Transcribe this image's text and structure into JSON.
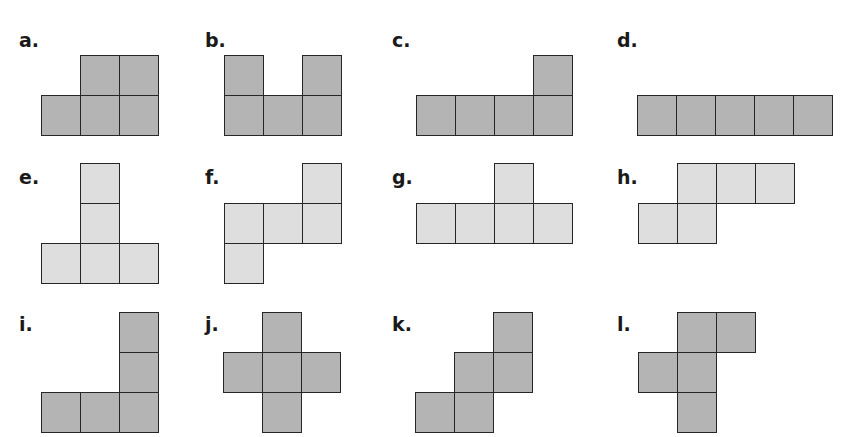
{
  "figure": {
    "cell_size": {
      "w": 39,
      "h": 40
    },
    "colors": {
      "dark_fill": "#b4b4b4",
      "light_fill": "#dedede",
      "border": "#262626",
      "label": "#1a1a1a"
    },
    "pentominoes": [
      {
        "label": "a.",
        "label_pos": [
          19,
          31
        ],
        "origin": [
          41,
          55
        ],
        "fill": "dark",
        "cells": [
          [
            1,
            0
          ],
          [
            2,
            0
          ],
          [
            0,
            1
          ],
          [
            1,
            1
          ],
          [
            2,
            1
          ]
        ]
      },
      {
        "label": "b.",
        "label_pos": [
          205,
          31
        ],
        "origin": [
          224,
          55
        ],
        "fill": "dark",
        "cells": [
          [
            0,
            0
          ],
          [
            2,
            0
          ],
          [
            0,
            1
          ],
          [
            1,
            1
          ],
          [
            2,
            1
          ]
        ]
      },
      {
        "label": "c.",
        "label_pos": [
          392,
          31
        ],
        "origin": [
          416,
          55
        ],
        "fill": "dark",
        "cells": [
          [
            3,
            0
          ],
          [
            0,
            1
          ],
          [
            1,
            1
          ],
          [
            2,
            1
          ],
          [
            3,
            1
          ]
        ]
      },
      {
        "label": "d.",
        "label_pos": [
          617,
          31
        ],
        "origin": [
          637,
          55
        ],
        "fill": "dark",
        "cells": [
          [
            0,
            1
          ],
          [
            1,
            1
          ],
          [
            2,
            1
          ],
          [
            3,
            1
          ],
          [
            4,
            1
          ]
        ]
      },
      {
        "label": "e.",
        "label_pos": [
          19,
          168
        ],
        "origin": [
          41,
          163
        ],
        "fill": "light",
        "cells": [
          [
            1,
            0
          ],
          [
            1,
            1
          ],
          [
            0,
            2
          ],
          [
            1,
            2
          ],
          [
            2,
            2
          ]
        ]
      },
      {
        "label": "f.",
        "label_pos": [
          205,
          168
        ],
        "origin": [
          224,
          163
        ],
        "fill": "light",
        "cells": [
          [
            2,
            0
          ],
          [
            0,
            1
          ],
          [
            1,
            1
          ],
          [
            2,
            1
          ],
          [
            0,
            2
          ]
        ]
      },
      {
        "label": "g.",
        "label_pos": [
          392,
          168
        ],
        "origin": [
          416,
          163
        ],
        "fill": "light",
        "cells": [
          [
            2,
            0
          ],
          [
            0,
            1
          ],
          [
            1,
            1
          ],
          [
            2,
            1
          ],
          [
            3,
            1
          ]
        ]
      },
      {
        "label": "h.",
        "label_pos": [
          617,
          168
        ],
        "origin": [
          638,
          163
        ],
        "fill": "light",
        "cells": [
          [
            1,
            0
          ],
          [
            2,
            0
          ],
          [
            3,
            0
          ],
          [
            0,
            1
          ],
          [
            1,
            1
          ]
        ]
      },
      {
        "label": "i.",
        "label_pos": [
          19,
          315
        ],
        "origin": [
          41,
          312
        ],
        "fill": "dark",
        "cells": [
          [
            2,
            0
          ],
          [
            2,
            1
          ],
          [
            0,
            2
          ],
          [
            1,
            2
          ],
          [
            2,
            2
          ]
        ]
      },
      {
        "label": "j.",
        "label_pos": [
          205,
          315
        ],
        "origin": [
          223,
          312
        ],
        "fill": "dark",
        "cells": [
          [
            1,
            0
          ],
          [
            0,
            1
          ],
          [
            1,
            1
          ],
          [
            2,
            1
          ],
          [
            1,
            2
          ]
        ]
      },
      {
        "label": "k.",
        "label_pos": [
          392,
          315
        ],
        "origin": [
          415,
          312
        ],
        "fill": "dark",
        "cells": [
          [
            2,
            0
          ],
          [
            1,
            1
          ],
          [
            2,
            1
          ],
          [
            0,
            2
          ],
          [
            1,
            2
          ]
        ]
      },
      {
        "label": "l.",
        "label_pos": [
          617,
          315
        ],
        "origin": [
          638,
          312
        ],
        "fill": "dark",
        "cells": [
          [
            1,
            0
          ],
          [
            2,
            0
          ],
          [
            0,
            1
          ],
          [
            1,
            1
          ],
          [
            1,
            2
          ]
        ]
      }
    ]
  }
}
